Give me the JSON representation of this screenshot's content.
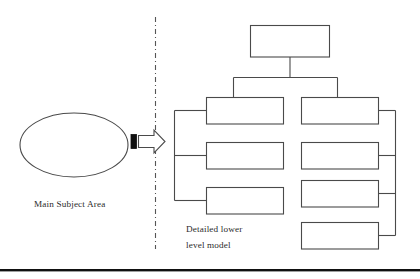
{
  "diagram": {
    "background_color": "#ffffff",
    "stroke_color": "#4a4a4a",
    "text_color": "#2b2b2b",
    "accent_color": "#111111",
    "left_panel": {
      "shape": "ellipse",
      "caption": "Main Subject Area"
    },
    "divider": {
      "style": "dash-dot",
      "orientation": "vertical"
    },
    "transition_arrow": {
      "icon": "block-arrow-right-icon",
      "direction": "right"
    },
    "right_panel": {
      "caption_line_1": "Detailed lower",
      "caption_line_2": "level model",
      "root": {
        "label": ""
      },
      "left_column": [
        {
          "label": ""
        },
        {
          "label": ""
        },
        {
          "label": ""
        }
      ],
      "right_column": [
        {
          "label": ""
        },
        {
          "label": ""
        },
        {
          "label": ""
        },
        {
          "label": ""
        }
      ]
    },
    "footer_rule": {
      "visible": true
    }
  }
}
